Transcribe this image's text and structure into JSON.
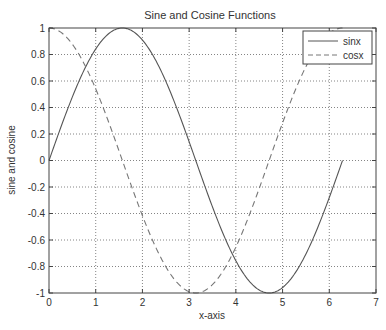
{
  "chart_data": {
    "type": "line",
    "title": "Sine and Cosine Functions",
    "xlabel": "x-axis",
    "ylabel": "sine and cosine",
    "xlim": [
      0,
      7
    ],
    "ylim": [
      -1,
      1
    ],
    "xticks": [
      "0",
      "1",
      "2",
      "3",
      "4",
      "5",
      "6",
      "7"
    ],
    "yticks": [
      "1",
      "0.8",
      "0.6",
      "0.4",
      "0.2",
      "0",
      "-0.2",
      "-0.4",
      "-0.6",
      "-0.8",
      "-1"
    ],
    "grid": true,
    "legend_position": "upper right",
    "x_range": [
      0,
      6.2832
    ],
    "series": [
      {
        "name": "sinx",
        "function": "sin(x)",
        "style": "solid",
        "color": "#555555",
        "x": [
          0,
          0.5,
          1,
          1.5708,
          2,
          2.5,
          3,
          3.5,
          4,
          4.7124,
          5,
          5.5,
          6,
          6.2832
        ],
        "values": [
          0,
          0.479,
          0.841,
          1,
          0.909,
          0.598,
          0.141,
          -0.351,
          -0.757,
          -1,
          -0.959,
          -0.706,
          -0.279,
          0
        ]
      },
      {
        "name": "cosx",
        "function": "cos(x)",
        "style": "dashed",
        "color": "#777777",
        "x": [
          0,
          0.5,
          1,
          1.5708,
          2,
          2.5,
          3.1416,
          3.5,
          4,
          4.7124,
          5,
          5.5,
          6,
          6.2832
        ],
        "values": [
          1,
          0.878,
          0.54,
          0,
          -0.416,
          -0.801,
          -1,
          -0.936,
          -0.654,
          0,
          0.284,
          0.709,
          0.96,
          1
        ]
      }
    ]
  }
}
